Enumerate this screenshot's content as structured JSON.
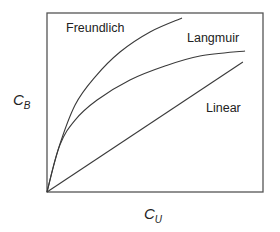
{
  "chart_data": {
    "type": "line",
    "title": "",
    "xlabel": {
      "main": "C",
      "sub": "U"
    },
    "ylabel": {
      "main": "C",
      "sub": "B"
    },
    "xlim": [
      0,
      1
    ],
    "ylim": [
      0,
      1
    ],
    "grid": false,
    "ticks": false,
    "series": [
      {
        "name": "Freundlich",
        "x": [
          0,
          0.051,
          0.13,
          0.222,
          0.338,
          0.477,
          0.625
        ],
        "y": [
          0,
          0.235,
          0.486,
          0.642,
          0.782,
          0.894,
          0.972
        ]
      },
      {
        "name": "Langmuir",
        "x": [
          0,
          0.06,
          0.13,
          0.232,
          0.384,
          0.546,
          0.708,
          0.917
        ],
        "y": [
          0,
          0.263,
          0.402,
          0.514,
          0.626,
          0.704,
          0.76,
          0.788
        ]
      },
      {
        "name": "Linear",
        "x": [
          0,
          0.907
        ],
        "y": [
          0,
          0.726
        ]
      }
    ],
    "annotations": [
      {
        "text": "Freundlich",
        "series": "Freundlich",
        "position": "upper-left"
      },
      {
        "text": "Langmuir",
        "series": "Langmuir",
        "position": "upper-right"
      },
      {
        "text": "Linear",
        "series": "Linear",
        "position": "below-right"
      }
    ]
  }
}
